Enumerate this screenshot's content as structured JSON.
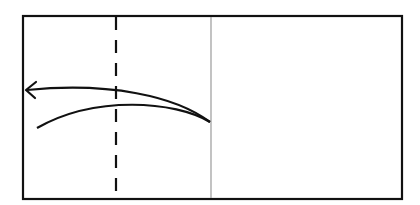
{
  "diagram": {
    "type": "origami-fold-step",
    "colors": {
      "stroke": "#111111",
      "center_crease": "#9a9a9a",
      "background": "#ffffff"
    },
    "paper": {
      "x1": 23,
      "y1": 16,
      "x2": 402,
      "y2": 199
    },
    "center_crease": {
      "x": 211,
      "y1": 16,
      "y2": 199
    },
    "fold_line": {
      "x": 116,
      "y1": 16,
      "y2": 199,
      "style": "dashed"
    },
    "arrows": [
      {
        "name": "fold-arrow-upper",
        "from": [
          210,
          122
        ],
        "to": [
          26,
          90
        ],
        "head": "open"
      },
      {
        "name": "fold-arrow-lower",
        "from": [
          210,
          122
        ],
        "to": [
          37,
          128
        ],
        "head": "none"
      }
    ]
  }
}
